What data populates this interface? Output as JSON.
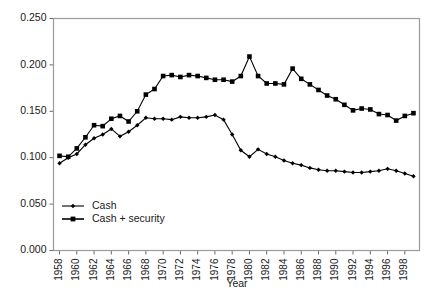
{
  "chart_data": {
    "type": "line",
    "title": "",
    "xlabel": "Year",
    "ylabel": "",
    "xlim": [
      1957.3,
      1999.7
    ],
    "ylim": [
      0.0,
      0.25
    ],
    "grid": false,
    "legend_position": "inside-bottom-left",
    "y_ticks": [
      0.0,
      0.05,
      0.1,
      0.15,
      0.2,
      0.25
    ],
    "y_tick_labels": [
      "0.000",
      "0.050",
      "0.100",
      "0.150",
      "0.200",
      "0.250"
    ],
    "x_ticks": [
      1958,
      1960,
      1962,
      1964,
      1966,
      1968,
      1970,
      1972,
      1974,
      1976,
      1978,
      1980,
      1982,
      1984,
      1986,
      1988,
      1990,
      1992,
      1994,
      1996,
      1998
    ],
    "x_tick_labels": [
      "1958",
      "1960",
      "1962",
      "1964",
      "1966",
      "1968",
      "1970",
      "1972",
      "1974",
      "1976",
      "1978",
      "1980",
      "1982",
      "1984",
      "1986",
      "1988",
      "1990",
      "1992",
      "1994",
      "1996",
      "1998"
    ],
    "x": [
      1958,
      1959,
      1960,
      1961,
      1962,
      1963,
      1964,
      1965,
      1966,
      1967,
      1968,
      1969,
      1970,
      1971,
      1972,
      1973,
      1974,
      1975,
      1976,
      1977,
      1978,
      1979,
      1980,
      1981,
      1982,
      1983,
      1984,
      1985,
      1986,
      1987,
      1988,
      1989,
      1990,
      1991,
      1992,
      1993,
      1994,
      1995,
      1996,
      1997,
      1998,
      1999
    ],
    "series": [
      {
        "name": "Cash + security",
        "marker": "square",
        "color": "#000000",
        "values": [
          0.102,
          0.101,
          0.11,
          0.122,
          0.135,
          0.134,
          0.142,
          0.145,
          0.139,
          0.15,
          0.168,
          0.174,
          0.188,
          0.189,
          0.187,
          0.189,
          0.188,
          0.186,
          0.184,
          0.184,
          0.182,
          0.188,
          0.209,
          0.188,
          0.18,
          0.18,
          0.179,
          0.196,
          0.185,
          0.179,
          0.173,
          0.167,
          0.163,
          0.157,
          0.151,
          0.153,
          0.152,
          0.147,
          0.146,
          0.14,
          0.145,
          0.148
        ]
      },
      {
        "name": "Cash",
        "marker": "diamond",
        "color": "#000000",
        "values": [
          0.094,
          0.1,
          0.104,
          0.114,
          0.121,
          0.125,
          0.131,
          0.123,
          0.128,
          0.135,
          0.143,
          0.142,
          0.142,
          0.141,
          0.144,
          0.143,
          0.143,
          0.144,
          0.146,
          0.141,
          0.125,
          0.108,
          0.101,
          0.109,
          0.104,
          0.101,
          0.097,
          0.094,
          0.092,
          0.089,
          0.087,
          0.086,
          0.086,
          0.085,
          0.084,
          0.084,
          0.085,
          0.086,
          0.088,
          0.086,
          0.083,
          0.08
        ]
      }
    ],
    "series_tail": [
      {
        "name": "Cash + security",
        "values_1979_1999": [
          0.188,
          0.209,
          0.188,
          0.18,
          0.18,
          0.179,
          0.196,
          0.185,
          0.179,
          0.173,
          0.167,
          0.163,
          0.157,
          0.151,
          0.153,
          0.152,
          0.147,
          0.146,
          0.14,
          0.145,
          0.148
        ]
      }
    ]
  },
  "legend": {
    "entries": [
      {
        "label": "Cash",
        "marker": "diamond"
      },
      {
        "label": "Cash + security",
        "marker": "square"
      }
    ]
  },
  "axis": {
    "x_title": "Year"
  }
}
